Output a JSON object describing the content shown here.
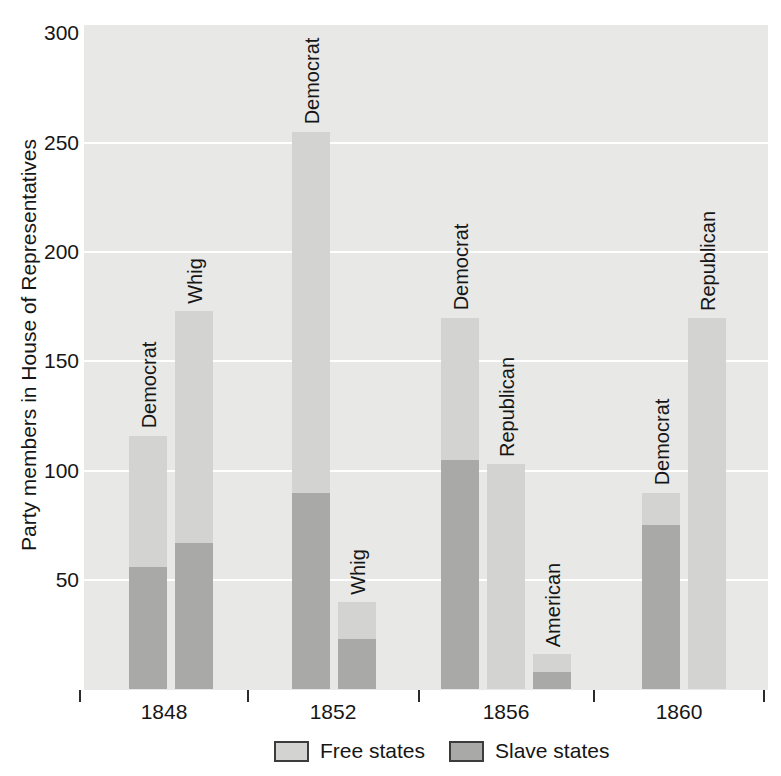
{
  "chart_data": {
    "type": "bar",
    "stacked": true,
    "title": "",
    "xlabel": "",
    "ylabel": "Party members in House of Representatives",
    "ylim": [
      0,
      300
    ],
    "yticks": [
      50,
      100,
      150,
      200,
      250,
      300
    ],
    "grid": "horizontal white gridlines on gray plot background",
    "legend_position": "bottom",
    "legend": [
      {
        "label": "Free states",
        "color": "#d3d3d2"
      },
      {
        "label": "Slave states",
        "color": "#a9a9a8"
      }
    ],
    "groups": [
      {
        "year": "1848",
        "bars": [
          {
            "party": "Democrat",
            "free_states": 60,
            "slave_states": 56,
            "total": 116
          },
          {
            "party": "Whig",
            "free_states": 106,
            "slave_states": 67,
            "total": 173
          }
        ]
      },
      {
        "year": "1852",
        "bars": [
          {
            "party": "Democrat",
            "free_states": 165,
            "slave_states": 90,
            "total": 255
          },
          {
            "party": "Whig",
            "free_states": 17,
            "slave_states": 23,
            "total": 40
          }
        ]
      },
      {
        "year": "1856",
        "bars": [
          {
            "party": "Democrat",
            "free_states": 65,
            "slave_states": 105,
            "total": 170
          },
          {
            "party": "Republican",
            "free_states": 103,
            "slave_states": 0,
            "total": 103
          },
          {
            "party": "American",
            "free_states": 8,
            "slave_states": 8,
            "total": 16
          }
        ]
      },
      {
        "year": "1860",
        "bars": [
          {
            "party": "Democrat",
            "free_states": 15,
            "slave_states": 75,
            "total": 90
          },
          {
            "party": "Republican",
            "free_states": 170,
            "slave_states": 0,
            "total": 170
          }
        ]
      }
    ],
    "colors": {
      "plot_background": "#e8e8e7",
      "free_states": "#d3d3d2",
      "slave_states": "#a9a9a8",
      "gridline": "#ffffff",
      "text": "#161616"
    }
  }
}
